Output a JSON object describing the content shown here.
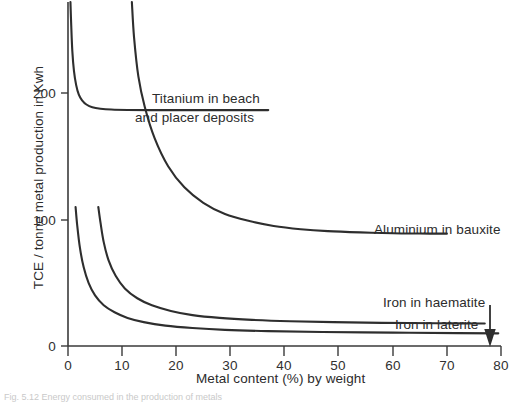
{
  "chart_data": {
    "type": "line",
    "title": "",
    "xlabel": "Metal content (%) by weight",
    "ylabel": "TCE / tonne metal production in Kwh",
    "xlim": [
      0,
      80
    ],
    "ylim": [
      0,
      245
    ],
    "grid": false,
    "legend_position": "inline-right",
    "xticks": [
      0,
      10,
      20,
      30,
      40,
      50,
      60,
      70,
      80
    ],
    "xtick_labels": [
      "0",
      "10",
      "20",
      "30",
      "40",
      "50",
      "60",
      "70",
      "80"
    ],
    "yticks": [
      0,
      100,
      200
    ],
    "ytick_labels": [
      "0",
      "100",
      "200"
    ],
    "series": [
      {
        "name": "Titanium in beach and placer deposits",
        "label_lines": [
          "Titanium in beach",
          "and placer deposits"
        ],
        "asymptote_y": 168,
        "x": [
          0.45,
          0.6,
          0.8,
          1.1,
          1.5,
          2.0,
          2.6,
          3.4,
          4.5,
          6.0,
          8.0,
          11.0,
          15.0,
          20.0,
          26.0,
          32.0,
          37.0
        ],
        "y": [
          245,
          228,
          210,
          196,
          186,
          179,
          175,
          172,
          170,
          169,
          168.4,
          168.1,
          168,
          168,
          168,
          168,
          168
        ]
      },
      {
        "name": "Aluminium in bauxite",
        "label_lines": [
          "Aluminium in bauxite"
        ],
        "asymptote_y": 80,
        "x": [
          11.8,
          12.2,
          13.0,
          14.2,
          16.0,
          18.5,
          21.5,
          25.0,
          29.0,
          33.5,
          38.0,
          43.0,
          48.0,
          54.0,
          60.0,
          65.0,
          70.0
        ],
        "y": [
          245,
          220,
          192,
          170,
          148,
          128,
          113,
          102,
          94,
          89,
          85.5,
          83.2,
          81.8,
          80.9,
          80.3,
          80.1,
          80
        ]
      },
      {
        "name": "Iron in haematite",
        "label_lines": [
          "Iron in haematite"
        ],
        "asymptote_y": 16,
        "x": [
          5.6,
          6.0,
          6.6,
          7.5,
          8.8,
          10.5,
          12.8,
          15.5,
          19.0,
          23.0,
          28.0,
          34.0,
          41.0,
          49.0,
          58.0,
          68.0,
          77.0
        ],
        "y": [
          99,
          88,
          74,
          61,
          50,
          41,
          34,
          29,
          25,
          22,
          20,
          18.6,
          17.6,
          17.0,
          16.5,
          16.2,
          16
        ]
      },
      {
        "name": "Iron in laterite",
        "label_lines": [
          "Iron in laterite"
        ],
        "asymptote_y": 9,
        "x": [
          1.4,
          1.7,
          2.2,
          2.9,
          3.8,
          5.0,
          6.6,
          8.6,
          11.0,
          14.0,
          18.0,
          23.0,
          29.0,
          37.0,
          47.0,
          60.0,
          72.0,
          79.5
        ],
        "y": [
          99,
          86,
          70,
          56,
          45,
          36,
          29,
          24,
          20,
          17,
          14.5,
          12.8,
          11.5,
          10.6,
          10.0,
          9.5,
          9.2,
          9
        ]
      }
    ],
    "annotations": [
      {
        "name": "haematite-pointer-arrow",
        "kind": "arrow",
        "points_to_x": 78,
        "points_to_y": 16
      }
    ]
  },
  "caption": {
    "text": "Fig. 5.12  Energy consumed in the production of metals"
  }
}
